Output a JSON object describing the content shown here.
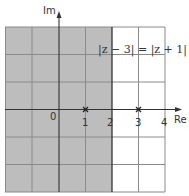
{
  "diagram": {
    "axes": {
      "x_label": "Re",
      "y_label": "Im",
      "x_ticks": [
        "0",
        "1",
        "2",
        "3",
        "4"
      ],
      "x_range": [
        -2,
        4
      ],
      "y_range": [
        -3,
        3
      ]
    },
    "equation": "|z − 3| = |z + 1|",
    "points": [
      {
        "label": "1",
        "re": 1,
        "im": 0,
        "marker": "x"
      },
      {
        "label": "3",
        "re": 3,
        "im": 0,
        "marker": "x"
      }
    ],
    "boundary_line": {
      "re": 2,
      "description": "perpendicular bisector Re(z)=2"
    },
    "shaded_region": {
      "description": "Re(z) < 2",
      "color": "#bdbdbd"
    },
    "colors": {
      "shade": "#bdbdbd",
      "grid": "#8a8a8a",
      "axis": "#333333",
      "background": "#ffffff"
    }
  }
}
